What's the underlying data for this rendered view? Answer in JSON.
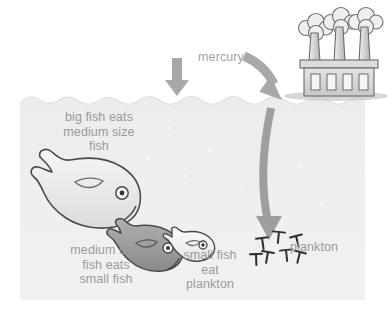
{
  "diagram": {
    "labels": {
      "mercury": "mercury",
      "big_fish": "big fish eats\nmedium size\nfish",
      "medium_fish": "medium size\nfish eats\nsmall fish",
      "small_fish": "small fish\neat\nplankton",
      "plankton": "plankton"
    },
    "colors": {
      "background": "#ffffff",
      "water": "#eeeeee",
      "water_edge": "#e3e3e3",
      "text": "#9a9a9a",
      "arrow": "#9e9e9e",
      "outline": "#4a4a4a",
      "big_fish_fill": "#ededed",
      "medium_fish_fill": "#9b9b9b",
      "small_fish_fill": "#f2f2f2",
      "plankton": "#2e2e2e",
      "factory_body": "#d8d8d8",
      "factory_outline": "#6b6b6b",
      "smoke": "#e9e9e9",
      "shadow": "#c9c9c9"
    },
    "icons": {
      "factory": "factory-icon",
      "smoke": "smoke-cloud-icon",
      "big_fish": "big-fish-icon",
      "medium_fish": "medium-fish-icon",
      "small_fish": "small-fish-icon",
      "plankton": "plankton-icon",
      "arrow_down": "arrow-down-icon",
      "arrow_curve_in": "curved-arrow-icon",
      "arrow_descend": "long-descending-arrow-icon"
    },
    "counts": {
      "smokestacks": 3,
      "factory_windows": 4,
      "plankton": 7,
      "fish": 3
    }
  }
}
